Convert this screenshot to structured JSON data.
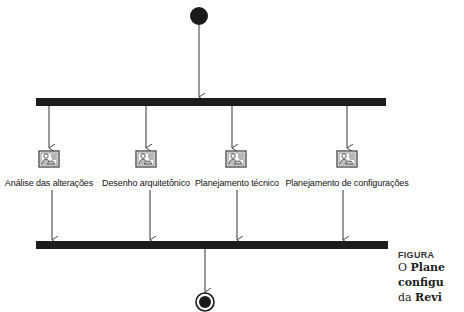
{
  "diagram": {
    "type": "uml-activity",
    "initial_node": {
      "x": 199,
      "y": 16
    },
    "fork_bar": {
      "x1": 36,
      "x2": 386,
      "y": 102
    },
    "join_bar": {
      "x1": 36,
      "x2": 388,
      "y": 245
    },
    "final_node": {
      "x": 205,
      "y": 302
    },
    "activities": [
      {
        "label": "Análise das alterações",
        "x": 49
      },
      {
        "label": "Desenho arquitetônico",
        "x": 146
      },
      {
        "label": "Planejamento técnico",
        "x": 236
      },
      {
        "label": "Planejamento de configurações",
        "x": 347
      }
    ]
  },
  "caption": {
    "figure_label": "FIGURA",
    "line1_prefix": "O ",
    "line1_bold": "Plane",
    "line2_bold": "configu",
    "line3_prefix": "da ",
    "line3_bold": "Revi"
  }
}
